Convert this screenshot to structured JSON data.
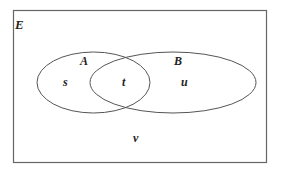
{
  "diagram": {
    "type": "venn",
    "universal_set": {
      "label": "E"
    },
    "sets": [
      {
        "label": "A"
      },
      {
        "label": "B"
      }
    ],
    "regions": {
      "A_only": "s",
      "A_and_B": "t",
      "B_only": "u",
      "outside": "v"
    },
    "colors": {
      "stroke": "#555555",
      "text": "#222222",
      "background": "#ffffff"
    }
  }
}
